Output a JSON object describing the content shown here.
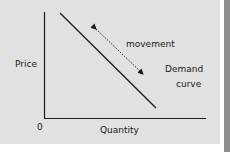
{
  "diagram": {
    "type": "demand-curve",
    "axes": {
      "y_label": "Price",
      "x_label": "Quantity",
      "origin_label": "0"
    },
    "curve_label_line1": "Demand",
    "curve_label_line2": "curve",
    "arrow_label": "movement",
    "colors": {
      "panel": "#e1e1e1",
      "line": "#1a1a1a",
      "side_bar": "#8c8c8c"
    }
  }
}
